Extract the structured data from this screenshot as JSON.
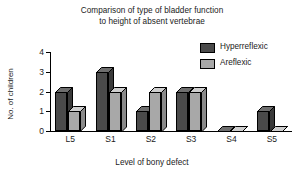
{
  "chart_data": {
    "type": "bar",
    "title": "Comparison of type of bladder function to height of absent vertebrae",
    "title_lines": [
      "Comparison of type of bladder function",
      "to height of absent vertebrae"
    ],
    "xlabel": "Level of bony defect",
    "ylabel": "No. of children",
    "categories": [
      "L5",
      "S1",
      "S2",
      "S3",
      "S4",
      "S5"
    ],
    "series": [
      {
        "name": "Hyperreflexic",
        "color": "#4a4a4a",
        "values": [
          2,
          3,
          1,
          2,
          0,
          1
        ]
      },
      {
        "name": "Areflexic",
        "color": "#a8a8a8",
        "values": [
          1,
          2,
          2,
          2,
          0,
          0
        ]
      }
    ],
    "ylim": [
      0,
      4
    ],
    "yticks": [
      0,
      1,
      2,
      3,
      4
    ],
    "ytick_labels": [
      "0",
      "1",
      "2",
      "3",
      "4"
    ],
    "grid": false,
    "legend_position": "top-right",
    "style": "3d-bar",
    "background_color": "#ffffff",
    "axis_color": "#000000",
    "text_color": "#1a1a1a"
  }
}
